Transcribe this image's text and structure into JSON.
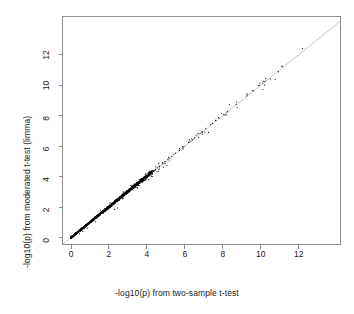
{
  "chart_data": {
    "type": "scatter",
    "title": "",
    "xlabel": "-log10(p) from two-sample t-test",
    "ylabel": "-log10(p) from moderated t-test (limma)",
    "xlim": [
      -0.45,
      14.2
    ],
    "ylim": [
      -0.45,
      14.5
    ],
    "xticks": [
      0,
      2,
      4,
      6,
      8,
      10,
      12
    ],
    "yticks": [
      0,
      2,
      4,
      6,
      8,
      10,
      12
    ],
    "xtick_labels": [
      "0",
      "2",
      "4",
      "6",
      "8",
      "10",
      "12"
    ],
    "ytick_labels": [
      "0",
      "2",
      "4",
      "6",
      "8",
      "10",
      "12"
    ],
    "grid": false,
    "legend": null,
    "point_color": "#000000",
    "point_size": 1.1,
    "reference_line": {
      "name": "identity-line",
      "type": "abline",
      "slope": 1,
      "intercept": 0,
      "color": "#9a9a9a",
      "width": 0.6
    },
    "box_color": "#8c8c8c",
    "series": [
      {
        "name": "genes",
        "n_points": 1180,
        "points": [
          [
            0.02,
            0.03
          ],
          [
            0.03,
            0.04
          ],
          [
            0.04,
            0.04
          ],
          [
            0.05,
            0.06
          ],
          [
            0.06,
            0.06
          ],
          [
            0.07,
            0.08
          ],
          [
            0.08,
            0.09
          ],
          [
            0.09,
            0.09
          ],
          [
            0.1,
            0.11
          ],
          [
            0.11,
            0.12
          ],
          [
            0.12,
            0.12
          ],
          [
            0.13,
            0.14
          ],
          [
            0.14,
            0.15
          ],
          [
            0.15,
            0.15
          ],
          [
            0.16,
            0.17
          ],
          [
            0.17,
            0.18
          ],
          [
            0.18,
            0.18
          ],
          [
            0.19,
            0.2
          ],
          [
            0.2,
            0.21
          ],
          [
            0.21,
            0.21
          ],
          [
            0.22,
            0.23
          ],
          [
            0.23,
            0.24
          ],
          [
            0.24,
            0.24
          ],
          [
            0.25,
            0.26
          ],
          [
            0.26,
            0.27
          ],
          [
            0.27,
            0.27
          ],
          [
            0.28,
            0.29
          ],
          [
            0.29,
            0.3
          ],
          [
            0.3,
            0.3
          ],
          [
            0.31,
            0.32
          ],
          [
            0.32,
            0.33
          ],
          [
            0.33,
            0.33
          ],
          [
            0.34,
            0.35
          ],
          [
            0.35,
            0.36
          ],
          [
            0.36,
            0.36
          ],
          [
            0.37,
            0.38
          ],
          [
            0.38,
            0.39
          ],
          [
            0.39,
            0.39
          ],
          [
            0.4,
            0.41
          ],
          [
            0.41,
            0.42
          ],
          [
            0.42,
            0.42
          ],
          [
            0.43,
            0.44
          ],
          [
            0.44,
            0.45
          ],
          [
            0.45,
            0.45
          ],
          [
            0.46,
            0.47
          ],
          [
            0.47,
            0.48
          ],
          [
            0.48,
            0.48
          ],
          [
            0.49,
            0.5
          ],
          [
            0.5,
            0.51
          ],
          [
            0.51,
            0.51
          ],
          [
            0.52,
            0.53
          ],
          [
            0.53,
            0.54
          ],
          [
            0.54,
            0.54
          ],
          [
            0.55,
            0.56
          ],
          [
            0.56,
            0.57
          ],
          [
            0.57,
            0.57
          ],
          [
            0.58,
            0.59
          ],
          [
            0.59,
            0.6
          ],
          [
            0.6,
            0.6
          ],
          [
            0.61,
            0.62
          ],
          [
            0.62,
            0.63
          ],
          [
            0.63,
            0.63
          ],
          [
            0.64,
            0.65
          ],
          [
            0.65,
            0.66
          ],
          [
            0.66,
            0.66
          ],
          [
            0.67,
            0.68
          ],
          [
            0.68,
            0.69
          ],
          [
            0.69,
            0.69
          ],
          [
            0.7,
            0.71
          ],
          [
            0.71,
            0.72
          ],
          [
            0.72,
            0.72
          ],
          [
            0.73,
            0.74
          ],
          [
            0.74,
            0.75
          ],
          [
            0.75,
            0.75
          ],
          [
            0.76,
            0.77
          ],
          [
            0.77,
            0.78
          ],
          [
            0.78,
            0.78
          ],
          [
            0.79,
            0.8
          ],
          [
            0.8,
            0.81
          ],
          [
            0.81,
            0.81
          ],
          [
            0.82,
            0.83
          ],
          [
            0.83,
            0.84
          ],
          [
            0.84,
            0.85
          ],
          [
            0.85,
            0.85
          ],
          [
            0.86,
            0.87
          ],
          [
            0.87,
            0.88
          ],
          [
            0.88,
            0.88
          ],
          [
            0.89,
            0.9
          ],
          [
            0.9,
            0.91
          ],
          [
            0.91,
            0.91
          ],
          [
            0.92,
            0.93
          ],
          [
            0.93,
            0.94
          ],
          [
            0.94,
            0.94
          ],
          [
            0.95,
            0.96
          ],
          [
            0.96,
            0.97
          ],
          [
            0.97,
            0.97
          ],
          [
            0.98,
            0.99
          ],
          [
            0.99,
            1.0
          ],
          [
            1.0,
            1.01
          ],
          [
            1.02,
            1.03
          ],
          [
            1.04,
            1.05
          ],
          [
            1.06,
            1.07
          ],
          [
            1.08,
            1.09
          ],
          [
            1.1,
            1.11
          ],
          [
            1.12,
            1.13
          ],
          [
            1.14,
            1.15
          ],
          [
            1.16,
            1.17
          ],
          [
            1.18,
            1.19
          ],
          [
            1.2,
            1.21
          ],
          [
            1.22,
            1.23
          ],
          [
            1.24,
            1.25
          ],
          [
            1.26,
            1.27
          ],
          [
            1.28,
            1.29
          ],
          [
            1.3,
            1.31
          ],
          [
            1.32,
            1.33
          ],
          [
            1.34,
            1.35
          ],
          [
            1.36,
            1.37
          ],
          [
            1.38,
            1.39
          ],
          [
            1.4,
            1.41
          ],
          [
            1.42,
            1.43
          ],
          [
            1.44,
            1.45
          ],
          [
            1.46,
            1.47
          ],
          [
            1.48,
            1.49
          ],
          [
            1.5,
            1.51
          ],
          [
            1.52,
            1.53
          ],
          [
            1.54,
            1.55
          ],
          [
            1.56,
            1.57
          ],
          [
            1.58,
            1.59
          ],
          [
            1.6,
            1.61
          ],
          [
            1.62,
            1.63
          ],
          [
            1.64,
            1.65
          ],
          [
            1.66,
            1.67
          ],
          [
            1.68,
            1.69
          ],
          [
            1.7,
            1.71
          ],
          [
            1.72,
            1.73
          ],
          [
            1.74,
            1.75
          ],
          [
            1.76,
            1.77
          ],
          [
            1.78,
            1.79
          ],
          [
            1.8,
            1.81
          ],
          [
            1.82,
            1.83
          ],
          [
            1.84,
            1.85
          ],
          [
            1.86,
            1.87
          ],
          [
            1.88,
            1.89
          ],
          [
            1.9,
            1.91
          ],
          [
            1.92,
            1.93
          ],
          [
            1.94,
            1.95
          ],
          [
            1.96,
            1.97
          ],
          [
            1.98,
            1.99
          ],
          [
            2.0,
            2.01
          ],
          [
            2.04,
            2.05
          ],
          [
            2.08,
            2.09
          ],
          [
            2.12,
            2.13
          ],
          [
            2.16,
            2.17
          ],
          [
            2.2,
            2.21
          ],
          [
            2.24,
            2.25
          ],
          [
            2.28,
            2.29
          ],
          [
            2.32,
            2.33
          ],
          [
            2.36,
            2.37
          ],
          [
            2.4,
            2.41
          ],
          [
            2.44,
            2.45
          ],
          [
            2.48,
            2.49
          ],
          [
            2.52,
            2.53
          ],
          [
            2.56,
            2.57
          ],
          [
            2.6,
            2.61
          ],
          [
            2.64,
            2.65
          ],
          [
            2.68,
            2.69
          ],
          [
            2.72,
            2.73
          ],
          [
            2.76,
            2.77
          ],
          [
            2.8,
            2.81
          ],
          [
            2.84,
            2.85
          ],
          [
            2.88,
            2.89
          ],
          [
            2.92,
            2.93
          ],
          [
            2.96,
            2.97
          ],
          [
            3.0,
            3.01
          ],
          [
            3.06,
            3.08
          ],
          [
            3.12,
            3.14
          ],
          [
            3.18,
            3.2
          ],
          [
            3.24,
            3.26
          ],
          [
            3.3,
            3.32
          ],
          [
            3.36,
            3.38
          ],
          [
            3.42,
            3.44
          ],
          [
            3.48,
            3.5
          ],
          [
            3.54,
            3.56
          ],
          [
            3.6,
            3.62
          ],
          [
            3.66,
            3.68
          ],
          [
            3.72,
            3.74
          ],
          [
            3.78,
            3.8
          ],
          [
            3.84,
            3.86
          ],
          [
            3.9,
            3.92
          ],
          [
            3.96,
            3.98
          ],
          [
            4.05,
            4.08
          ],
          [
            4.15,
            4.18
          ],
          [
            4.25,
            4.28
          ],
          [
            4.35,
            4.38
          ],
          [
            4.45,
            4.48
          ],
          [
            4.55,
            4.58
          ],
          [
            4.65,
            4.68
          ],
          [
            4.8,
            4.83
          ],
          [
            4.95,
            4.98
          ],
          [
            5.1,
            5.14
          ],
          [
            5.3,
            5.34
          ],
          [
            5.5,
            5.54
          ],
          [
            5.7,
            5.74
          ],
          [
            5.95,
            5.99
          ],
          [
            6.2,
            6.24
          ],
          [
            6.5,
            6.54
          ],
          [
            6.8,
            6.84
          ],
          [
            7.1,
            7.14
          ],
          [
            7.45,
            7.49
          ],
          [
            7.8,
            7.84
          ],
          [
            8.2,
            8.24
          ],
          [
            8.7,
            8.74
          ],
          [
            9.25,
            9.29
          ],
          [
            9.6,
            9.64
          ],
          [
            10.1,
            10.14
          ],
          [
            12.2,
            12.4
          ],
          [
            2.3,
            1.85
          ],
          [
            2.45,
            1.95
          ],
          [
            3.5,
            3.25
          ],
          [
            3.62,
            3.4
          ],
          [
            1.3,
            1.05
          ],
          [
            0.85,
            0.62
          ],
          [
            2.05,
            2.3
          ],
          [
            1.55,
            1.8
          ],
          [
            4.1,
            3.8
          ],
          [
            4.6,
            4.35
          ],
          [
            5.05,
            4.75
          ],
          [
            3.95,
            4.2
          ],
          [
            2.75,
            3.0
          ],
          [
            3.15,
            3.42
          ],
          [
            0.45,
            0.25
          ],
          [
            0.62,
            0.4
          ]
        ]
      }
    ]
  },
  "axes": {
    "x_title": "-log10(p) from two-sample t-test",
    "y_title": "-log10(p) from moderated t-test (limma)"
  }
}
